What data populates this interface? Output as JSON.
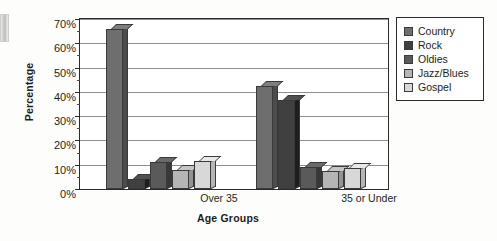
{
  "chart_data": {
    "type": "bar",
    "title": "",
    "xlabel": "Age Groups",
    "ylabel": "Percentage",
    "categories": [
      "Over 35",
      "35 or Under"
    ],
    "ylim": [
      0,
      70
    ],
    "ytick_labels": [
      "0%",
      "10%",
      "20%",
      "30%",
      "40%",
      "50%",
      "60%",
      "70%"
    ],
    "ytick_values": [
      0,
      10,
      20,
      30,
      40,
      50,
      60,
      70
    ],
    "minor_tick_step": 5,
    "grid": true,
    "legend_position": "top-right",
    "series": [
      {
        "name": "Country",
        "color": "#6e6e6e",
        "values": [
          66.0,
          42.5
        ]
      },
      {
        "name": "Rock",
        "color": "#404040",
        "values": [
          4.0,
          36.5
        ]
      },
      {
        "name": "Oldies",
        "color": "#5a5a5a",
        "values": [
          11.0,
          9.0
        ]
      },
      {
        "name": "Jazz/Blues",
        "color": "#b5b5b5",
        "values": [
          8.0,
          7.5
        ]
      },
      {
        "name": "Gospel",
        "color": "#d8d8d8",
        "values": [
          11.5,
          8.5
        ]
      }
    ]
  }
}
